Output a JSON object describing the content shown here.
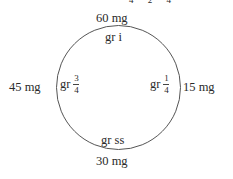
{
  "diagram": {
    "type": "dosage-equivalence-circle",
    "top_partial_text": "4 2 4",
    "circle": {
      "cx": 118.5,
      "cy": 87.5,
      "r": 62,
      "stroke": "#555555"
    },
    "positions": {
      "top": {
        "outer": "60 mg",
        "inner": "gr i"
      },
      "right": {
        "outer": "15 mg",
        "inner_prefix": "gr",
        "inner_num": "1",
        "inner_den": "4"
      },
      "bottom": {
        "outer": "30 mg",
        "inner": "gr ss"
      },
      "left": {
        "outer": "45 mg",
        "inner_prefix": "gr",
        "inner_num": "3",
        "inner_den": "4"
      }
    }
  }
}
